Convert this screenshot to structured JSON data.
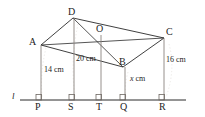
{
  "figure": {
    "line_label": "l",
    "vertices": [
      {
        "id": "A",
        "label": "A",
        "x": 41,
        "y": 45,
        "label_x": 29,
        "label_y": 38
      },
      {
        "id": "B",
        "label": "B",
        "x": 123,
        "y": 67,
        "label_x": 120,
        "label_y": 58
      },
      {
        "id": "C",
        "label": "C",
        "x": 164,
        "y": 38,
        "label_x": 167,
        "label_y": 28
      },
      {
        "id": "D",
        "label": "D",
        "x": 73,
        "y": 18,
        "label_x": 69,
        "label_y": 8
      },
      {
        "id": "O",
        "label": "O",
        "x": 101,
        "y": 35,
        "label_x": 98,
        "label_y": 25
      }
    ],
    "feet": [
      {
        "id": "P",
        "label": "P",
        "x": 41,
        "label_x": 37,
        "label_y": 104
      },
      {
        "id": "S",
        "label": "S",
        "x": 74,
        "label_x": 70,
        "label_y": 104
      },
      {
        "id": "T",
        "label": "T",
        "x": 101,
        "label_x": 97,
        "label_y": 104
      },
      {
        "id": "Q",
        "label": "Q",
        "x": 125,
        "label_x": 121,
        "label_y": 104
      },
      {
        "id": "R",
        "label": "R",
        "x": 164,
        "label_x": 160,
        "label_y": 104
      }
    ],
    "measurements": [
      {
        "id": "AP",
        "text": "14 cm",
        "x": 44,
        "y": 66
      },
      {
        "id": "DS",
        "text": "20 cm",
        "x": 77,
        "y": 56
      },
      {
        "id": "BQ",
        "value": "x",
        "unit": "cm",
        "x": 130,
        "y": 76
      },
      {
        "id": "CR",
        "text": "16 cm",
        "x": 167,
        "y": 57
      }
    ],
    "baseline_y": 100,
    "baseline_x_start": 20,
    "baseline_x_end": 186,
    "line_label_x": 12,
    "line_label_y": 95,
    "colors": {
      "stroke": "#2a2a2a",
      "faint": "#b9b3ae",
      "background": "#ffffff"
    }
  }
}
